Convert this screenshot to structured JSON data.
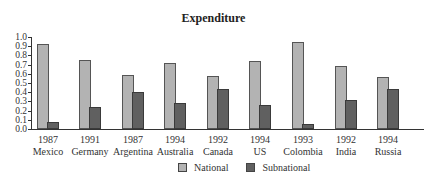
{
  "chart_data": {
    "type": "bar",
    "title": "Expenditure",
    "xlabel": "",
    "ylabel": "",
    "ylim": [
      0,
      1.0
    ],
    "yticks": [
      "0.0",
      "0.1",
      "0.2",
      "0.3",
      "0.4",
      "0.5",
      "0.6",
      "0.7",
      "0.8",
      "0.9",
      "1.0"
    ],
    "grid": false,
    "legend_position": "bottom",
    "categories": [
      {
        "year": "1987",
        "country": "Mexico"
      },
      {
        "year": "1991",
        "country": "Germany"
      },
      {
        "year": "1987",
        "country": "Argentina"
      },
      {
        "year": "1994",
        "country": "Australia"
      },
      {
        "year": "1992",
        "country": "Canada"
      },
      {
        "year": "1994",
        "country": "US"
      },
      {
        "year": "1993",
        "country": "Colombia"
      },
      {
        "year": "1992",
        "country": "India"
      },
      {
        "year": "1994",
        "country": "Russia"
      }
    ],
    "series": [
      {
        "name": "National",
        "color": "#b3b3b3",
        "values": [
          0.92,
          0.75,
          0.59,
          0.72,
          0.58,
          0.74,
          0.95,
          0.69,
          0.57
        ]
      },
      {
        "name": "Subnational",
        "color": "#606060",
        "values": [
          0.08,
          0.24,
          0.4,
          0.28,
          0.43,
          0.26,
          0.05,
          0.32,
          0.44
        ]
      }
    ]
  }
}
